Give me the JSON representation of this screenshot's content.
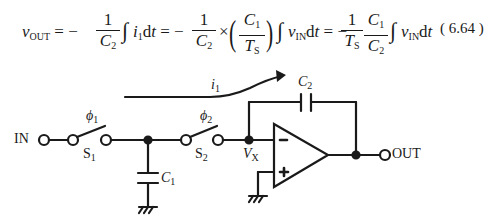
{
  "equation": {
    "lhs": "v",
    "lhs_sub": "OUT",
    "eq1_coef": "= −",
    "frac1": {
      "num": "1",
      "den": "C",
      "den_sub": "2"
    },
    "integral1": "∫",
    "term1": "i",
    "term1_sub": "1",
    "term1_d": "d",
    "term1_t": "t",
    "eq2_coef": "= −",
    "frac2": {
      "num": "1",
      "den": "C",
      "den_sub": "2"
    },
    "times": "×",
    "frac3": {
      "num": "C",
      "num_sub": "1",
      "den": "T",
      "den_sub": "S"
    },
    "integral2": "∫",
    "term2": "v",
    "term2_sub": "IN",
    "term2_d": "d",
    "term2_t": "t",
    "eq3_coef": "= −",
    "frac4": {
      "num": "1",
      "den": "T",
      "den_sub": "S"
    },
    "frac5": {
      "num": "C",
      "num_sub": "1",
      "den": "C",
      "den_sub": "2"
    },
    "integral3": "∫",
    "term3": "v",
    "term3_sub": "IN",
    "term3_d": "d",
    "term3_t": "t",
    "number": "( 6.64 )"
  },
  "circuit": {
    "input_label": "IN",
    "output_label": "OUT",
    "current_label": "i",
    "current_sub": "1",
    "switch1": {
      "phase": "ϕ",
      "phase_sub": "1",
      "name": "S",
      "name_sub": "1"
    },
    "switch2": {
      "phase": "ϕ",
      "phase_sub": "2",
      "name": "S",
      "name_sub": "2"
    },
    "cap1": {
      "name": "C",
      "sub": "1"
    },
    "cap2": {
      "name": "C",
      "sub": "2"
    },
    "node_label": "V",
    "node_sub": "X",
    "opamp": {
      "minus": "−",
      "plus": "+"
    },
    "colors": {
      "line": "#1a1a1a",
      "background": "#ffffff"
    }
  }
}
